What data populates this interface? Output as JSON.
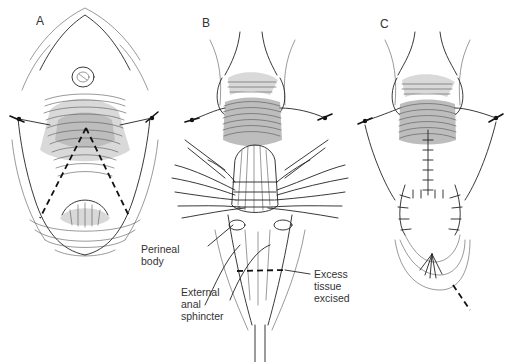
{
  "figure": {
    "panels": [
      {
        "id": "A",
        "label": "A",
        "description": "Perineum exposed with traction sutures; dashed triangular incision line marked"
      },
      {
        "id": "B",
        "label": "B",
        "description": "Sutures placed through perineal body and external anal sphincter; excess tissue excised"
      },
      {
        "id": "C",
        "label": "C",
        "description": "Closed repair with interrupted sutures; dashed line below"
      }
    ],
    "annotations": {
      "perineal_body": "Perineal\nbody",
      "external_anal_sphincter": "External\nanal\nsphincter",
      "excess_tissue_excised": "Excess\ntissue\nexcised"
    },
    "colors": {
      "background": "#ffffff",
      "ink": "#222222",
      "dashed_line": "#111111"
    }
  }
}
